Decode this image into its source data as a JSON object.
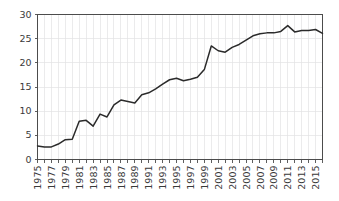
{
  "chart_data": {
    "type": "line",
    "title": "",
    "subtitle": "",
    "xlabel": "",
    "ylabel": "",
    "grid": true,
    "legend": false,
    "legend_position": "none",
    "line_color": "#2b2b2b",
    "grid_color": "#e2e2e4",
    "axis_color": "#4c4c4c",
    "xlim": [
      1975,
      2016
    ],
    "ylim": [
      0,
      30
    ],
    "yticks": [
      0,
      5,
      10,
      15,
      20,
      25,
      30
    ],
    "ytick_labels": [
      "0",
      "5",
      "10",
      "15",
      "20",
      "25",
      "30"
    ],
    "xticks": [
      1975,
      1977,
      1979,
      1981,
      1983,
      1985,
      1987,
      1989,
      1991,
      1993,
      1995,
      1997,
      1999,
      2001,
      2003,
      2005,
      2007,
      2009,
      2011,
      2013,
      2015
    ],
    "xtick_labels": [
      "1975",
      "1977",
      "1979",
      "1981",
      "1983",
      "1985",
      "1987",
      "1989",
      "1991",
      "1993",
      "1995",
      "1997",
      "1999",
      "2001",
      "2003",
      "2005",
      "2007",
      "2009",
      "2011",
      "2013",
      "2015"
    ],
    "x": [
      1975,
      1976,
      1977,
      1978,
      1979,
      1980,
      1981,
      1982,
      1983,
      1984,
      1985,
      1986,
      1987,
      1988,
      1989,
      1990,
      1991,
      1992,
      1993,
      1994,
      1995,
      1996,
      1997,
      1998,
      1999,
      2000,
      2001,
      2002,
      2003,
      2004,
      2005,
      2006,
      2007,
      2008,
      2009,
      2010,
      2011,
      2012,
      2013,
      2014,
      2015,
      2016
    ],
    "values": [
      2.8,
      2.6,
      2.6,
      3.2,
      4.1,
      4.2,
      7.9,
      8.1,
      6.9,
      9.4,
      8.8,
      11.3,
      12.3,
      12.0,
      11.7,
      13.4,
      13.8,
      14.6,
      15.6,
      16.5,
      16.8,
      16.3,
      16.6,
      17.0,
      18.6,
      23.5,
      22.5,
      22.2,
      23.2,
      23.8,
      24.7,
      25.6,
      26.0,
      26.2,
      26.2,
      26.5,
      27.7,
      26.4,
      26.7,
      26.7,
      26.9,
      26.1
    ],
    "series": [
      {
        "name": "series-1",
        "values": [
          2.8,
          2.6,
          2.6,
          3.2,
          4.1,
          4.2,
          7.9,
          8.1,
          6.9,
          9.4,
          8.8,
          11.3,
          12.3,
          12.0,
          11.7,
          13.4,
          13.8,
          14.6,
          15.6,
          16.5,
          16.8,
          16.3,
          16.6,
          17.0,
          18.6,
          23.5,
          22.5,
          22.2,
          23.2,
          23.8,
          24.7,
          25.6,
          26.0,
          26.2,
          26.2,
          26.5,
          27.7,
          26.4,
          26.7,
          26.7,
          26.9,
          26.1
        ]
      }
    ]
  }
}
